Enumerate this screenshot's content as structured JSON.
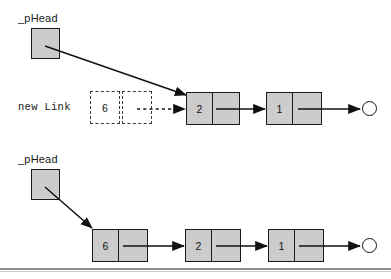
{
  "diagram": {
    "colors": {
      "node_fill": "#cccccc",
      "stroke": "#1a1a1a",
      "background": "#ffffff",
      "rule": "#8e8e8e",
      "dashed_stroke": "#3a3a3a"
    },
    "panels": [
      {
        "id": "before",
        "pointer_label": "_pHead",
        "new_link_label": "new Link",
        "pending_node": {
          "data": "6",
          "next": ""
        },
        "nodes": [
          {
            "data": "2",
            "next": ""
          },
          {
            "data": "1",
            "next": ""
          }
        ],
        "terminator": "null"
      },
      {
        "id": "after",
        "pointer_label": "_pHead",
        "nodes": [
          {
            "data": "6",
            "next": ""
          },
          {
            "data": "2",
            "next": ""
          },
          {
            "data": "1",
            "next": ""
          }
        ],
        "terminator": "null"
      }
    ]
  }
}
